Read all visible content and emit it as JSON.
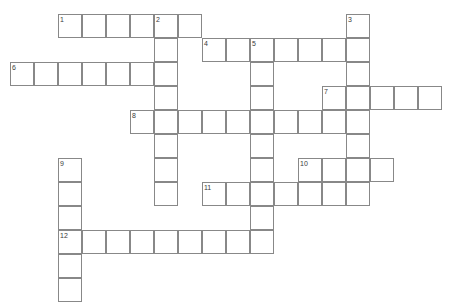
{
  "puzzle": {
    "title": "Crossword Puzzle Grid",
    "type": "crossword",
    "grid": {
      "cell_size": 24,
      "origin_x": 10,
      "origin_y": 14,
      "columns": 19,
      "rows": 12,
      "cell_border_color": "#888888",
      "cell_fill_color": "#ffffff",
      "background_color": "#ffffff",
      "number_color": "#3a3a3a"
    },
    "entries": [
      {
        "number": "1",
        "direction": "across",
        "row": 0,
        "col": 2,
        "length": 6
      },
      {
        "number": "2",
        "direction": "down",
        "row": 0,
        "col": 6,
        "length": 8
      },
      {
        "number": "3",
        "direction": "down",
        "row": 0,
        "col": 14,
        "length": 8
      },
      {
        "number": "4",
        "direction": "across",
        "row": 1,
        "col": 8,
        "length": 7
      },
      {
        "number": "5",
        "direction": "down",
        "row": 1,
        "col": 10,
        "length": 9
      },
      {
        "number": "6",
        "direction": "across",
        "row": 2,
        "col": 0,
        "length": 7
      },
      {
        "number": "7",
        "direction": "across",
        "row": 3,
        "col": 13,
        "length": 5
      },
      {
        "number": "8",
        "direction": "across",
        "row": 4,
        "col": 5,
        "length": 9
      },
      {
        "number": "9",
        "direction": "down",
        "row": 6,
        "col": 2,
        "length": 6
      },
      {
        "number": "10",
        "direction": "across",
        "row": 6,
        "col": 12,
        "length": 4
      },
      {
        "number": "11",
        "direction": "across",
        "row": 7,
        "col": 8,
        "length": 7
      },
      {
        "number": "12",
        "direction": "across",
        "row": 9,
        "col": 2,
        "length": 9
      }
    ],
    "numbers": [
      "1",
      "2",
      "3",
      "4",
      "5",
      "6",
      "7",
      "8",
      "9",
      "10",
      "11",
      "12"
    ],
    "cells": [
      {
        "row": 0,
        "col": 2,
        "number": "1"
      },
      {
        "row": 0,
        "col": 3
      },
      {
        "row": 0,
        "col": 4
      },
      {
        "row": 0,
        "col": 5
      },
      {
        "row": 0,
        "col": 6,
        "number": "2"
      },
      {
        "row": 0,
        "col": 7
      },
      {
        "row": 0,
        "col": 14,
        "number": "3"
      },
      {
        "row": 1,
        "col": 6
      },
      {
        "row": 1,
        "col": 8,
        "number": "4"
      },
      {
        "row": 1,
        "col": 9
      },
      {
        "row": 1,
        "col": 10,
        "number": "5"
      },
      {
        "row": 1,
        "col": 11
      },
      {
        "row": 1,
        "col": 12
      },
      {
        "row": 1,
        "col": 13
      },
      {
        "row": 1,
        "col": 14
      },
      {
        "row": 2,
        "col": 0,
        "number": "6"
      },
      {
        "row": 2,
        "col": 1
      },
      {
        "row": 2,
        "col": 2
      },
      {
        "row": 2,
        "col": 3
      },
      {
        "row": 2,
        "col": 4
      },
      {
        "row": 2,
        "col": 5
      },
      {
        "row": 2,
        "col": 6
      },
      {
        "row": 2,
        "col": 10
      },
      {
        "row": 2,
        "col": 14
      },
      {
        "row": 3,
        "col": 6
      },
      {
        "row": 3,
        "col": 10
      },
      {
        "row": 3,
        "col": 13,
        "number": "7"
      },
      {
        "row": 3,
        "col": 14
      },
      {
        "row": 3,
        "col": 15
      },
      {
        "row": 3,
        "col": 16
      },
      {
        "row": 3,
        "col": 17
      },
      {
        "row": 4,
        "col": 5,
        "number": "8"
      },
      {
        "row": 4,
        "col": 6
      },
      {
        "row": 4,
        "col": 7
      },
      {
        "row": 4,
        "col": 8
      },
      {
        "row": 4,
        "col": 9
      },
      {
        "row": 4,
        "col": 10
      },
      {
        "row": 4,
        "col": 11
      },
      {
        "row": 4,
        "col": 12
      },
      {
        "row": 4,
        "col": 13
      },
      {
        "row": 4,
        "col": 14
      },
      {
        "row": 5,
        "col": 6
      },
      {
        "row": 5,
        "col": 10
      },
      {
        "row": 5,
        "col": 14
      },
      {
        "row": 6,
        "col": 2,
        "number": "9"
      },
      {
        "row": 6,
        "col": 6
      },
      {
        "row": 6,
        "col": 10
      },
      {
        "row": 6,
        "col": 12,
        "number": "10"
      },
      {
        "row": 6,
        "col": 13
      },
      {
        "row": 6,
        "col": 14
      },
      {
        "row": 6,
        "col": 15
      },
      {
        "row": 7,
        "col": 2
      },
      {
        "row": 7,
        "col": 6
      },
      {
        "row": 7,
        "col": 8,
        "number": "11"
      },
      {
        "row": 7,
        "col": 9
      },
      {
        "row": 7,
        "col": 10
      },
      {
        "row": 7,
        "col": 11
      },
      {
        "row": 7,
        "col": 12
      },
      {
        "row": 7,
        "col": 13
      },
      {
        "row": 7,
        "col": 14
      },
      {
        "row": 8,
        "col": 2
      },
      {
        "row": 8,
        "col": 10
      },
      {
        "row": 9,
        "col": 2,
        "number": "12"
      },
      {
        "row": 9,
        "col": 3
      },
      {
        "row": 9,
        "col": 4
      },
      {
        "row": 9,
        "col": 5
      },
      {
        "row": 9,
        "col": 6
      },
      {
        "row": 9,
        "col": 7
      },
      {
        "row": 9,
        "col": 8
      },
      {
        "row": 9,
        "col": 9
      },
      {
        "row": 9,
        "col": 10
      },
      {
        "row": 10,
        "col": 2
      },
      {
        "row": 11,
        "col": 2
      }
    ]
  }
}
